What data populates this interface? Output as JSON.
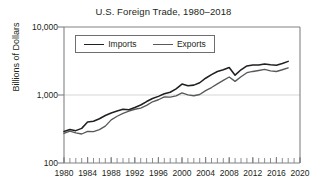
{
  "chart_data": {
    "type": "line",
    "title": "U.S. Foreign Trade, 1980–2018",
    "xlabel": "",
    "ylabel": "Billions of Dollars",
    "yscale": "log",
    "ylim": [
      100,
      10000
    ],
    "ytick_labels": [
      "10,000",
      "1,000",
      "100"
    ],
    "ytick_values": [
      10000,
      1000,
      100
    ],
    "xlim": [
      1980,
      2020
    ],
    "xtick_labels": [
      "1980",
      "1984",
      "1988",
      "1992",
      "1996",
      "2000",
      "2004",
      "2008",
      "2012",
      "2016",
      "2020"
    ],
    "xtick_values": [
      1980,
      1984,
      1988,
      1992,
      1996,
      2000,
      2004,
      2008,
      2012,
      2016,
      2020
    ],
    "xtick_minor_interval": 1,
    "grid": "horizontal-1000-only",
    "legend_position": "top-left-inside",
    "x": [
      1980,
      1981,
      1982,
      1983,
      1984,
      1985,
      1986,
      1987,
      1988,
      1989,
      1990,
      1991,
      1992,
      1993,
      1994,
      1995,
      1996,
      1997,
      1998,
      1999,
      2000,
      2001,
      2002,
      2003,
      2004,
      2005,
      2006,
      2007,
      2008,
      2009,
      2010,
      2011,
      2012,
      2013,
      2014,
      2015,
      2016,
      2017,
      2018
    ],
    "series": [
      {
        "name": "Imports",
        "color": "#231f20",
        "values": [
          291,
          310,
          299,
          323,
          400,
          411,
          448,
          500,
          545,
          580,
          616,
          609,
          656,
          713,
          801,
          890,
          955,
          1042,
          1099,
          1231,
          1449,
          1369,
          1398,
          1514,
          1764,
          1996,
          2212,
          2346,
          2541,
          1956,
          2348,
          2676,
          2755,
          2755,
          2866,
          2786,
          2738,
          2903,
          3121
        ]
      },
      {
        "name": "Exports",
        "color": "#58595b",
        "values": [
          272,
          294,
          277,
          267,
          291,
          289,
          310,
          349,
          431,
          487,
          536,
          578,
          617,
          643,
          703,
          795,
          851,
          938,
          933,
          969,
          1071,
          1005,
          975,
          1018,
          1161,
          1287,
          1457,
          1645,
          1840,
          1587,
          1853,
          2128,
          2219,
          2295,
          2377,
          2264,
          2215,
          2352,
          2510
        ]
      }
    ]
  }
}
